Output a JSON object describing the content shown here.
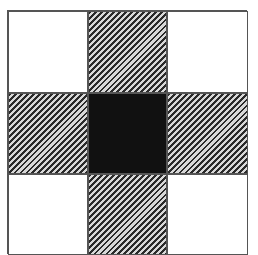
{
  "diagram": {
    "type": "3x3 grid pattern",
    "rows": 3,
    "cols": 3,
    "cells": [
      {
        "row": 0,
        "col": 0,
        "fill": "white"
      },
      {
        "row": 0,
        "col": 1,
        "fill": "hatched"
      },
      {
        "row": 0,
        "col": 2,
        "fill": "white"
      },
      {
        "row": 1,
        "col": 0,
        "fill": "hatched"
      },
      {
        "row": 1,
        "col": 1,
        "fill": "black"
      },
      {
        "row": 1,
        "col": 2,
        "fill": "hatched"
      },
      {
        "row": 2,
        "col": 0,
        "fill": "white"
      },
      {
        "row": 2,
        "col": 1,
        "fill": "hatched"
      },
      {
        "row": 2,
        "col": 2,
        "fill": "white"
      }
    ],
    "colors": {
      "white": "#ffffff",
      "black": "#111111",
      "hatch_dark": "#2a2a2a",
      "hatch_light": "#d8d8d8",
      "border": "#555555"
    }
  }
}
